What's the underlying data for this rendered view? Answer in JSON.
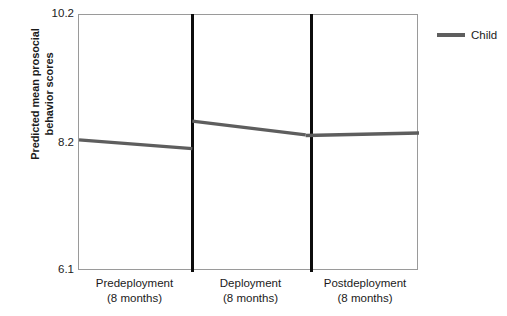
{
  "chart_data": {
    "type": "line",
    "title": "",
    "subtitle": "",
    "xlabel": "",
    "ylabel": "Predicted mean prosocial behavior scores",
    "ylabel_lines": [
      "Predicted mean prosocial",
      "behavior scores"
    ],
    "ylim": [
      6.1,
      10.2
    ],
    "yticks": [
      10.2,
      8.2,
      6.1
    ],
    "ytick_labels": [
      "10.2",
      "8.2",
      "6.1"
    ],
    "grid": false,
    "legend_position": "right",
    "panel_dividers": true,
    "categories": [
      "Predeployment (8 months)",
      "Deployment (8 months)",
      "Postdeployment (8 months)"
    ],
    "xtick_labels": [
      {
        "main": "Predeployment",
        "sub": "(8 months)"
      },
      {
        "main": "Deployment",
        "sub": "(8 months)"
      },
      {
        "main": "Postdeployment",
        "sub": "(8 months)"
      }
    ],
    "series": [
      {
        "name": "Child",
        "color": "#5e5e5e",
        "segments": [
          {
            "phase": "Predeployment (8 months)",
            "start": 8.2,
            "end": 8.06
          },
          {
            "phase": "Deployment (8 months)",
            "start": 8.5,
            "end": 8.28
          },
          {
            "phase": "Postdeployment (8 months)",
            "start": 8.27,
            "end": 8.31
          }
        ]
      }
    ]
  },
  "legend": {
    "entries": [
      {
        "label": "Child",
        "color": "#5e5e5e"
      }
    ]
  },
  "axis": {
    "y_tick_top": "10.2",
    "y_tick_mid": "8.2",
    "y_tick_bottom": "6.1",
    "y_title_line1": "Predicted mean prosocial",
    "y_title_line2": "behavior scores"
  },
  "xaxis": {
    "tick1_main": "Predeployment",
    "tick1_sub": "(8 months)",
    "tick2_main": "Deployment",
    "tick2_sub": "(8 months)",
    "tick3_main": "Postdeployment",
    "tick3_sub": "(8 months)"
  }
}
